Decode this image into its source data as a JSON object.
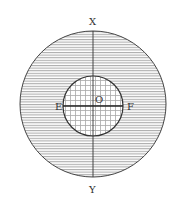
{
  "diagram": {
    "type": "concentric-circles",
    "labels": {
      "top": "X",
      "bottom": "Y",
      "left": "E",
      "right": "F",
      "center": "O"
    },
    "colors": {
      "stroke": "#333333",
      "hatch": "#9a9a9a",
      "grid": "#a8a8a8",
      "background": "#ffffff"
    },
    "outer_circle": {
      "cx": 93,
      "cy": 104,
      "r": 73,
      "fill": "horizontal-hatch"
    },
    "inner_circle": {
      "cx": 93,
      "cy": 106,
      "r": 30,
      "fill": "grid-hatch"
    },
    "lines": [
      {
        "name": "XY",
        "x1": 93,
        "y1": 31,
        "x2": 93,
        "y2": 177
      },
      {
        "name": "EF",
        "x1": 63,
        "y1": 106,
        "x2": 123,
        "y2": 106
      }
    ]
  }
}
